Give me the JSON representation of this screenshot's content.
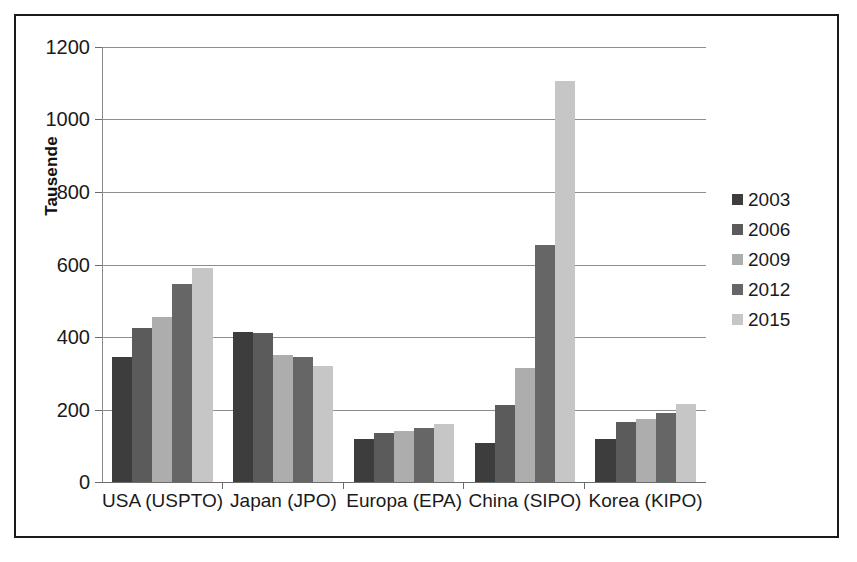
{
  "chart_data": {
    "type": "bar",
    "title": "",
    "subtitle": "",
    "xlabel": "",
    "ylabel": "Tausende",
    "ylim": [
      0,
      1200
    ],
    "ytick_step": 200,
    "yticks": [
      1200,
      1000,
      800,
      600,
      400,
      200,
      0
    ],
    "ytick_labels": [
      "1200",
      "1000",
      "800",
      "600",
      "400",
      "200",
      "0"
    ],
    "grid": "horizontal",
    "legend_position": "right",
    "categories": [
      "USA (USPTO)",
      "Japan (JPO)",
      "Europa (EPA)",
      "China (SIPO)",
      "Korea (KIPO)"
    ],
    "series": [
      {
        "name": "2003",
        "color": "#3d3d3d",
        "values": [
          345,
          415,
          118,
          108,
          120
        ]
      },
      {
        "name": "2006",
        "color": "#5b5b5b",
        "values": [
          425,
          410,
          135,
          212,
          165
        ]
      },
      {
        "name": "2009",
        "color": "#adadad",
        "values": [
          455,
          350,
          140,
          315,
          175
        ]
      },
      {
        "name": "2012",
        "color": "#666666",
        "values": [
          545,
          345,
          150,
          655,
          190
        ]
      },
      {
        "name": "2015",
        "color": "#c6c6c6",
        "values": [
          590,
          320,
          160,
          1105,
          215
        ]
      }
    ]
  },
  "frame": {
    "border_color": "#1a1a1a",
    "background": "#ffffff"
  },
  "axis": {
    "gridline_color": "#8d8d8d",
    "axis_line_color": "#6b6b6b"
  }
}
